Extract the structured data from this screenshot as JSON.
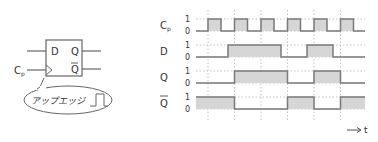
{
  "flipflop": {
    "input_d": "D",
    "output_q": "Q",
    "output_qbar": "Q",
    "clock_label": "C",
    "clock_sub": "p",
    "callout_text": "アップエッジ"
  },
  "timing": {
    "signals": [
      {
        "name": "C",
        "sub": "p",
        "overbar": false
      },
      {
        "name": "D",
        "sub": "",
        "overbar": false
      },
      {
        "name": "Q",
        "sub": "",
        "overbar": false
      },
      {
        "name": "Q",
        "sub": "",
        "overbar": true
      }
    ],
    "high_label": "1",
    "low_label": "0",
    "time_axis_label": "t",
    "colors": {
      "line": "#7a7a7a",
      "fill": "#d6d6d6",
      "grid": "#9a9a9a"
    }
  },
  "chart_data": {
    "type": "timing",
    "x_unit": "px",
    "clock_rising_edges": [
      208,
      234.5,
      261,
      287.5,
      314,
      340.5
    ],
    "signals": [
      {
        "name": "Cp",
        "initial": 0,
        "transitions": [
          208,
          221,
          234.5,
          247.5,
          261,
          274,
          287.5,
          300.5,
          314,
          327,
          340.5,
          353.5
        ]
      },
      {
        "name": "D",
        "initial": 0,
        "transitions": [
          228,
          281,
          307,
          333
        ]
      },
      {
        "name": "Q",
        "initial": 0,
        "transitions": [
          234.5,
          287.5,
          314,
          340.5
        ]
      },
      {
        "name": "Qbar",
        "initial": 1,
        "transitions": [
          234.5,
          287.5,
          314,
          340.5
        ]
      }
    ],
    "x_end": 365
  }
}
